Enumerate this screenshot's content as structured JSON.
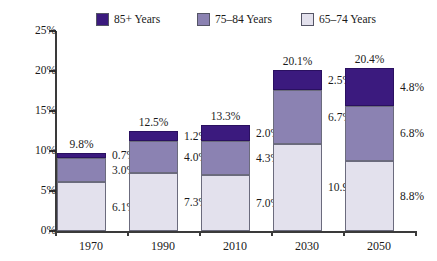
{
  "chart_data": {
    "type": "bar",
    "subtype": "stacked-bar",
    "title": "",
    "xlabel": "",
    "ylabel": "",
    "categories": [
      "1970",
      "1990",
      "2010",
      "2030",
      "2050"
    ],
    "ylim": [
      0,
      25
    ],
    "ytick_values": [
      0,
      5,
      10,
      15,
      20,
      25
    ],
    "ytick_labels": [
      "0%",
      "5%",
      "10%",
      "15%",
      "20%",
      "25%"
    ],
    "grid": false,
    "legend_position": "top",
    "value_suffix": "%",
    "series": [
      {
        "name": "65–74 Years",
        "color": "#E3E1ED",
        "values": [
          6.1,
          7.3,
          7.0,
          10.9,
          8.8
        ],
        "labels": [
          "6.1%",
          "7.3%",
          "7.0%",
          "10.9%",
          "8.8%"
        ]
      },
      {
        "name": "75–84 Years",
        "color": "#8B82B2",
        "values": [
          3.0,
          4.0,
          4.3,
          6.7,
          6.8
        ],
        "labels": [
          "3.0%",
          "4.0%",
          "4.3%",
          "6.7%",
          "6.8%"
        ]
      },
      {
        "name": "85+ Years",
        "color": "#3B1A7E",
        "values": [
          0.7,
          1.2,
          2.0,
          2.5,
          4.8
        ],
        "labels": [
          "0.7%",
          "1.2%",
          "2.0%",
          "2.5%",
          "4.8%"
        ]
      }
    ],
    "totals": [
      9.8,
      12.5,
      13.3,
      20.1,
      20.4
    ],
    "total_labels": [
      "9.8%",
      "12.5%",
      "13.3%",
      "20.1%",
      "20.4%"
    ]
  },
  "legend": {
    "items": [
      {
        "label": "85+ Years",
        "color": "#3B1A7E"
      },
      {
        "label": "75–84 Years",
        "color": "#8B82B2"
      },
      {
        "label": "65–74 Years",
        "color": "#E3E1ED"
      }
    ]
  },
  "axes": {
    "y_labels": [
      "25%",
      "20%",
      "15%",
      "10%",
      "5%",
      "0%"
    ],
    "x_labels": [
      "1970",
      "1990",
      "2010",
      "2030",
      "2050"
    ]
  }
}
